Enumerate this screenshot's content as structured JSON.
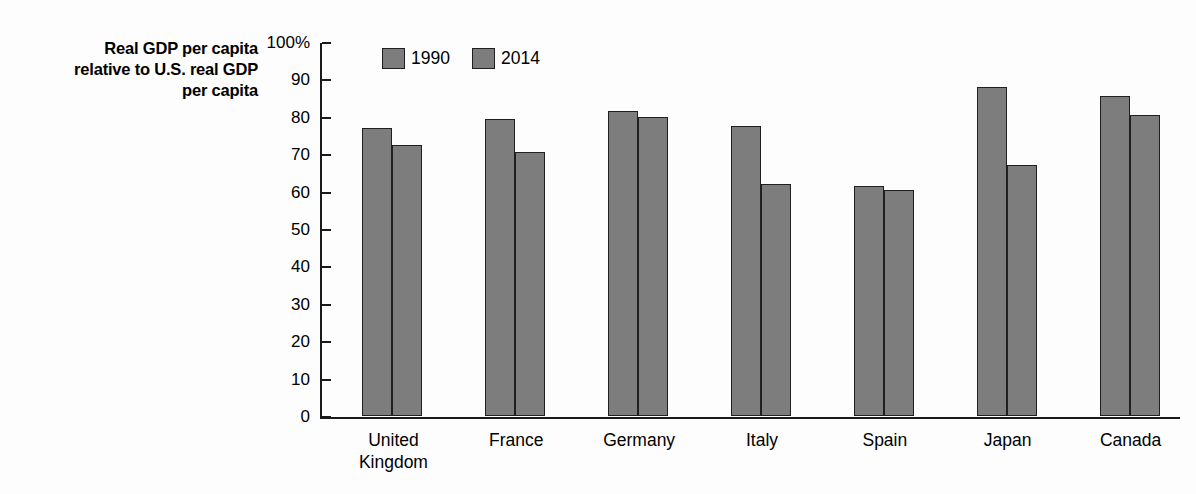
{
  "axis_title": {
    "line1": "Real GDP per capita",
    "line2": "relative to U.S. real GDP",
    "line3": "per capita"
  },
  "legend": {
    "items": [
      {
        "label": "1990",
        "color": "#7d7d7d"
      },
      {
        "label": "2014",
        "color": "#7d7d7d"
      }
    ]
  },
  "y_ticks": [
    "100%",
    "90",
    "80",
    "70",
    "60",
    "50",
    "40",
    "30",
    "20",
    "10",
    "0"
  ],
  "colors": {
    "bar_fill": "#7d7d7d",
    "bar_border": "#1f1f1f",
    "axis": "#1a1a1a",
    "background": "#fdfdfd",
    "text": "#000000"
  },
  "categories": [
    {
      "line1": "United",
      "line2": "Kingdom"
    },
    {
      "line1": "France",
      "line2": ""
    },
    {
      "line1": "Germany",
      "line2": ""
    },
    {
      "line1": "Italy",
      "line2": ""
    },
    {
      "line1": "Spain",
      "line2": ""
    },
    {
      "line1": "Japan",
      "line2": ""
    },
    {
      "line1": "Canada",
      "line2": ""
    }
  ],
  "chart_data": {
    "type": "bar",
    "title": "",
    "xlabel": "",
    "ylabel": "Real GDP per capita relative to U.S. real GDP per capita",
    "ylim": [
      0,
      100
    ],
    "ytick_step": 10,
    "grid": false,
    "legend_position": "top-left-inside",
    "categories": [
      "United Kingdom",
      "France",
      "Germany",
      "Italy",
      "Spain",
      "Japan",
      "Canada"
    ],
    "series": [
      {
        "name": "1990",
        "values": [
          77,
          79.5,
          81.5,
          77.5,
          61.5,
          88,
          85.5
        ]
      },
      {
        "name": "2014",
        "values": [
          72.5,
          70.5,
          80,
          62,
          60.5,
          67,
          80.5
        ]
      }
    ]
  }
}
